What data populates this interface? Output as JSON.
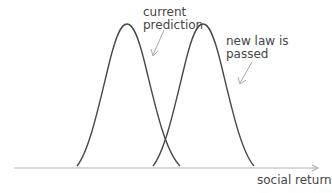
{
  "diagram": {
    "type": "two shifted bell curves on a horizontal axis",
    "axis": {
      "label": "social return",
      "color": "#b0b0b0"
    },
    "curves": [
      {
        "name": "current prediction",
        "label_lines": [
          "current",
          "prediction"
        ],
        "peak_x": 127,
        "color": "#474747"
      },
      {
        "name": "new law is passed",
        "label_lines": [
          "new law is",
          "passed"
        ],
        "peak_x": 203,
        "color": "#474747"
      }
    ],
    "annotations": [
      {
        "text": "current prediction",
        "points_to": "left curve"
      },
      {
        "text": "new law is passed",
        "points_to": "right curve"
      }
    ]
  }
}
